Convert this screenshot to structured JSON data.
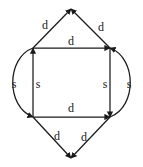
{
  "figure": {
    "type": "directed-graph-diagram",
    "background_color": "#ffffff",
    "stroke_color": "#1a1a1a",
    "label_color": "#1a1a1a",
    "nodes": [
      {
        "id": "top",
        "name": "top-apex-vertex",
        "x": 71,
        "y": 9
      },
      {
        "id": "top_left",
        "name": "top-left-square-vertex",
        "x": 33,
        "y": 48
      },
      {
        "id": "top_right",
        "name": "top-right-square-vertex",
        "x": 110,
        "y": 48
      },
      {
        "id": "bottom_left",
        "name": "bottom-left-square-vertex",
        "x": 33,
        "y": 117
      },
      {
        "id": "bottom_right",
        "name": "bottom-right-square-vertex",
        "x": 110,
        "y": 117
      },
      {
        "id": "bottom",
        "name": "bottom-apex-vertex",
        "x": 71,
        "y": 158
      }
    ],
    "edges": [
      {
        "id": "e1",
        "name": "edge-top-left-to-top",
        "label": "d",
        "label_x": 45,
        "label_y": 25
      },
      {
        "id": "e2",
        "name": "edge-top-right-to-top",
        "label": "d",
        "label_x": 101,
        "label_y": 27
      },
      {
        "id": "e3",
        "name": "edge-top-left-to-top-right",
        "label": "d",
        "label_x": 71,
        "label_y": 41
      },
      {
        "id": "e4",
        "name": "edge-left-outer-curve",
        "label": "s",
        "label_x": 14,
        "label_y": 84
      },
      {
        "id": "e5",
        "name": "edge-left-inner-vertical",
        "label": "s",
        "label_x": 38,
        "label_y": 84
      },
      {
        "id": "e6",
        "name": "edge-right-inner-vertical",
        "label": "s",
        "label_x": 105,
        "label_y": 84
      },
      {
        "id": "e7",
        "name": "edge-right-outer-curve",
        "label": "s",
        "label_x": 129,
        "label_y": 84
      },
      {
        "id": "e8",
        "name": "edge-bottom-left-to-bottom-right",
        "label": "d",
        "label_x": 71,
        "label_y": 108
      },
      {
        "id": "e9",
        "name": "edge-bottom-left-to-bottom",
        "label": "d",
        "label_x": 57,
        "label_y": 136
      },
      {
        "id": "e10",
        "name": "edge-bottom-right-to-bottom",
        "label": "d",
        "label_x": 84,
        "label_y": 137
      }
    ]
  }
}
